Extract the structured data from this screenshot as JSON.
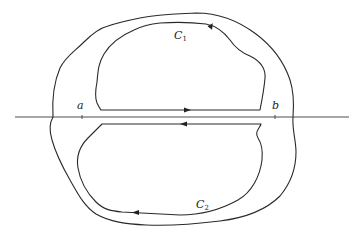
{
  "figure": {
    "type": "contour-diagram",
    "axis": {
      "orientation": "horizontal"
    },
    "points": [
      {
        "name": "a",
        "label": "a"
      },
      {
        "name": "b",
        "label": "b"
      }
    ],
    "contours": [
      {
        "name": "C1",
        "label_main": "C",
        "label_sub": "1",
        "region": "upper",
        "arrow_on_segment": "right",
        "arrow_on_curve": "counterclockwise"
      },
      {
        "name": "C2",
        "label_main": "C",
        "label_sub": "2",
        "region": "lower",
        "arrow_on_segment": "left",
        "arrow_on_curve": "counterclockwise"
      }
    ],
    "outer_contour": {
      "label": ""
    },
    "colors": {
      "stroke": "#2a2a2a",
      "background": "#ffffff"
    }
  }
}
